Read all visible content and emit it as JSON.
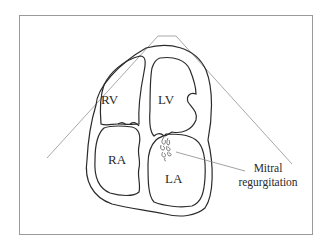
{
  "figure": {
    "type": "echocardiogram-apical-four-chamber-schematic",
    "chambers": [
      {
        "id": "rv",
        "label": "RV"
      },
      {
        "id": "lv",
        "label": "LV"
      },
      {
        "id": "ra",
        "label": "RA"
      },
      {
        "id": "la",
        "label": "LA"
      }
    ],
    "annotation": {
      "line1": "Mitral",
      "line2": "regurgitation"
    },
    "colors": {
      "outline": "#2b2b2b",
      "sector_line": "#a8a8a8",
      "frame": "#9a9a9a",
      "background": "#ffffff"
    }
  }
}
